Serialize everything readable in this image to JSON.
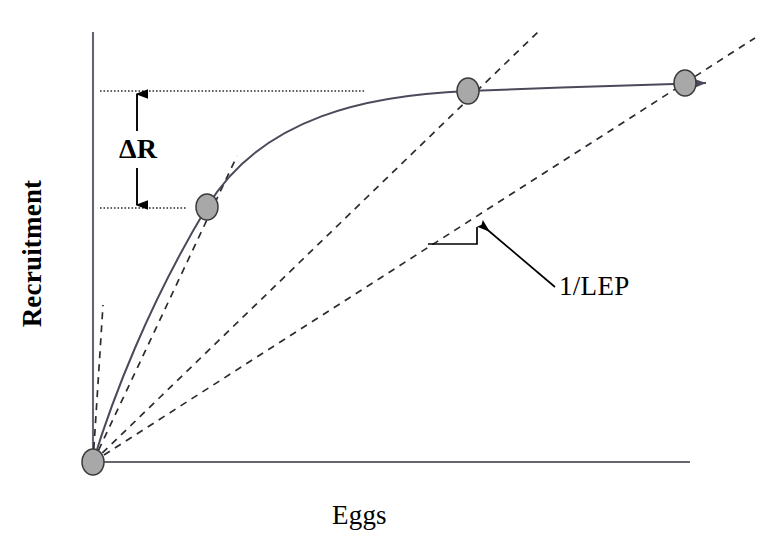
{
  "figure": {
    "type": "stock-recruitment-diagram",
    "background_color": "#ffffff"
  },
  "axes": {
    "y_title": "Recruitment",
    "x_title": "Eggs",
    "axis_color": "#555555",
    "y_axis": {
      "x": 93,
      "y_top": 32,
      "y_bottom": 462
    },
    "x_axis": {
      "y": 462,
      "x_left": 93,
      "x_right": 690
    }
  },
  "annotations": {
    "delta_r": "ΔR",
    "lep": "1/LEP",
    "delta_r_upper_line_y": 91,
    "delta_r_lower_line_y": 208,
    "dotted_color": "#333333"
  },
  "chart_data": {
    "type": "line",
    "title": "",
    "xlabel": "Eggs",
    "ylabel": "Recruitment",
    "grid": false,
    "legend": null,
    "curve_name": "stock-recruitment curve (Beverton-Holt type)",
    "curve_color": "#4a4a5a",
    "marker_fill": "#a8a8a8",
    "marker_stroke": "#333333",
    "points": [
      {
        "name": "origin",
        "x": 93,
        "y": 462,
        "label": "origin"
      },
      {
        "name": "point-low",
        "x": 207,
        "y": 207,
        "label": "low equilibrium"
      },
      {
        "name": "point-mid",
        "x": 468,
        "y": 91,
        "label": "mid equilibrium"
      },
      {
        "name": "point-high",
        "x": 685,
        "y": 83,
        "label": "high equilibrium"
      }
    ],
    "replacement_lines": [
      {
        "name": "replacement-line-steepest",
        "x1": 93,
        "y1": 462,
        "x2": 103,
        "y2": 305
      },
      {
        "name": "replacement-line-tangent-low",
        "x1": 93,
        "y1": 462,
        "x2": 237,
        "y2": 156
      },
      {
        "name": "replacement-line-mid",
        "x1": 93,
        "y1": 462,
        "x2": 540,
        "y2": 30
      },
      {
        "name": "replacement-line-high",
        "x1": 93,
        "y1": 462,
        "x2": 755,
        "y2": 38
      }
    ],
    "slope_marker": {
      "name": "slope-triangle",
      "h_x1": 428,
      "h_x2": 477,
      "h_y": 244,
      "v_y1": 244,
      "v_y2": 227
    },
    "leader_line": {
      "x1": 553,
      "y1": 286,
      "x2": 481,
      "y2": 224
    }
  }
}
